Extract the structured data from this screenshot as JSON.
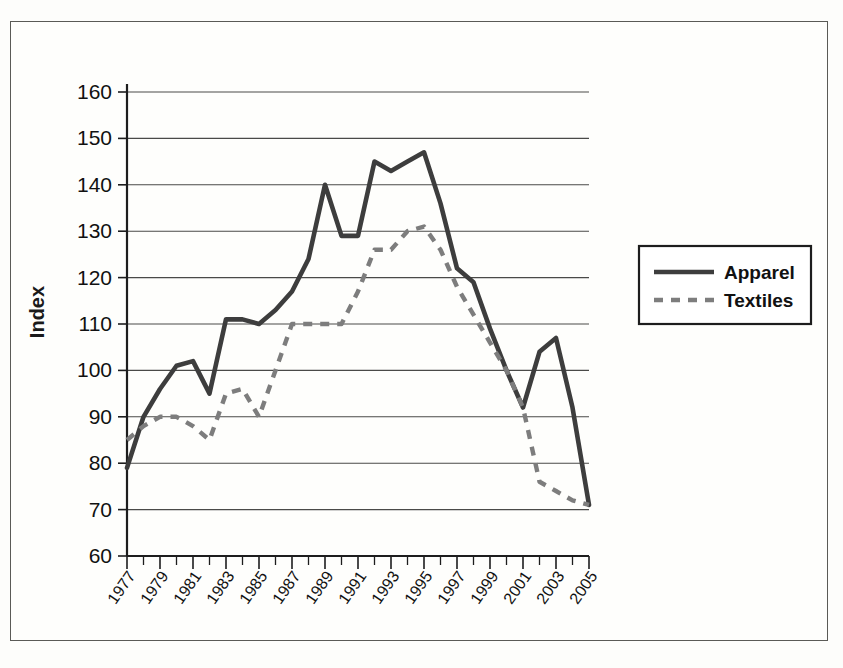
{
  "chart_data": {
    "type": "line",
    "title": "",
    "xlabel": "",
    "ylabel": "Index",
    "ylim": [
      60,
      160
    ],
    "ytick_step": 10,
    "yticks": [
      60,
      70,
      80,
      90,
      100,
      110,
      120,
      130,
      140,
      150,
      160
    ],
    "grid": true,
    "legend_position": "right",
    "x": [
      1977,
      1978,
      1979,
      1980,
      1981,
      1982,
      1983,
      1984,
      1985,
      1986,
      1987,
      1988,
      1989,
      1990,
      1991,
      1992,
      1993,
      1994,
      1995,
      1996,
      1997,
      1998,
      1999,
      2000,
      2001,
      2002,
      2003,
      2004,
      2005
    ],
    "xtick_labels": [
      "1977",
      "1979",
      "1981",
      "1983",
      "1985",
      "1987",
      "1989",
      "1991",
      "1993",
      "1995",
      "1997",
      "1999",
      "2001",
      "2003",
      "2005"
    ],
    "series": [
      {
        "name": "Apparel",
        "style": "solid",
        "color": "#3d3d3d",
        "values": [
          79,
          90,
          96,
          101,
          102,
          95,
          111,
          111,
          110,
          113,
          117,
          124,
          140,
          129,
          129,
          145,
          143,
          145,
          147,
          136,
          122,
          119,
          109,
          100,
          92,
          104,
          107,
          92,
          71
        ]
      },
      {
        "name": "Textiles",
        "style": "dashed",
        "color": "#7d7d7d",
        "values": [
          85,
          88,
          90,
          90,
          88,
          85,
          95,
          96,
          90,
          100,
          110,
          110,
          110,
          110,
          117,
          126,
          126,
          130,
          131,
          126,
          118,
          112,
          106,
          100,
          92,
          76,
          74,
          72,
          71
        ]
      }
    ]
  },
  "axis": {
    "y_title": "Index"
  },
  "legend": {
    "entries": [
      {
        "label": "Apparel",
        "style": "solid"
      },
      {
        "label": "Textiles",
        "style": "dashed"
      }
    ]
  }
}
